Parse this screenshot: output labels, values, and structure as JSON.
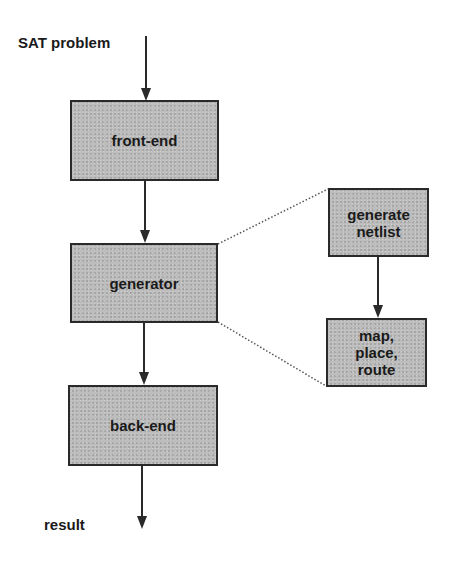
{
  "diagram": {
    "input_label": "SAT problem",
    "output_label": "result",
    "main_flow": [
      {
        "id": "front-end",
        "label": "front-end"
      },
      {
        "id": "generator",
        "label": "generator"
      },
      {
        "id": "back-end",
        "label": "back-end"
      }
    ],
    "detail_flow": [
      {
        "id": "generate-netlist",
        "label": "generate\nnetlist"
      },
      {
        "id": "map-place-route",
        "label": "map,\nplace,\nroute"
      }
    ],
    "edges": [
      {
        "from": "SAT problem",
        "to": "front-end"
      },
      {
        "from": "front-end",
        "to": "generator"
      },
      {
        "from": "generator",
        "to": "back-end"
      },
      {
        "from": "back-end",
        "to": "result"
      },
      {
        "from": "generate-netlist",
        "to": "map-place-route"
      }
    ],
    "expansion": {
      "node": "generator",
      "style": "dotted",
      "expands_to": [
        "generate-netlist",
        "map-place-route"
      ]
    },
    "colors": {
      "box_fill": "#bdbdbd",
      "stroke": "#2a2a2a"
    }
  }
}
